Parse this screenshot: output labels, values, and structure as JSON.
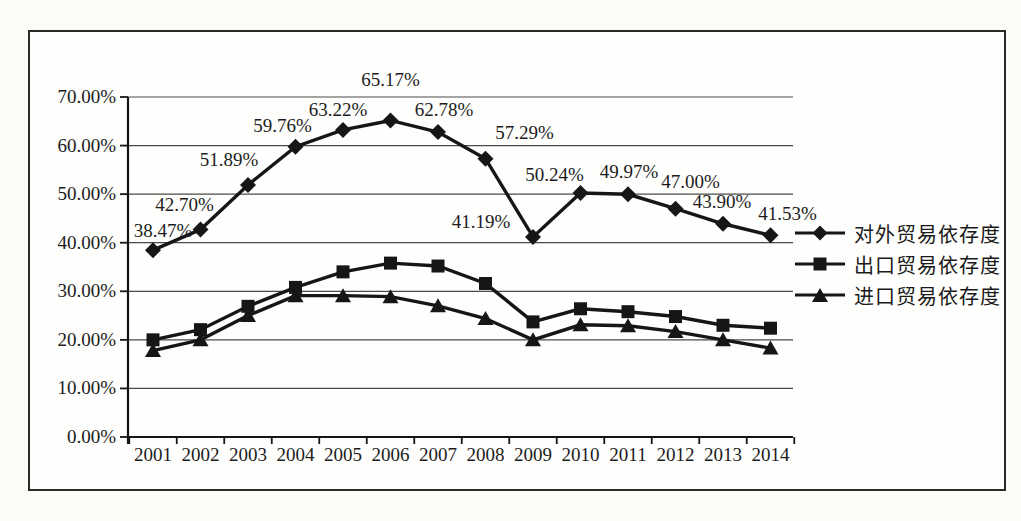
{
  "figure": {
    "background_color": "#fefefc",
    "border_color": "#2a2a2a",
    "ink_color": "#161616"
  },
  "chart_data": {
    "type": "line",
    "title": "",
    "xlabel": "",
    "ylabel": "",
    "categories": [
      "2001",
      "2002",
      "2003",
      "2004",
      "2005",
      "2006",
      "2007",
      "2008",
      "2009",
      "2010",
      "2011",
      "2012",
      "2013",
      "2014"
    ],
    "series": [
      {
        "name": "对外贸易依存度",
        "marker": "diamond",
        "values": [
          38.47,
          42.7,
          51.89,
          59.76,
          63.22,
          65.17,
          62.78,
          57.29,
          41.19,
          50.24,
          49.97,
          47.0,
          43.9,
          41.53
        ],
        "labels": [
          "38.47%",
          "42.70%",
          "51.89%",
          "59.76%",
          "63.22%",
          "65.17%",
          "62.78%",
          "57.29%",
          "41.19%",
          "50.24%",
          "49.97%",
          "47.00%",
          "43.90%",
          "41.53%"
        ]
      },
      {
        "name": "出口贸易依存度",
        "marker": "square",
        "values": [
          20.0,
          22.1,
          26.9,
          30.8,
          34.0,
          35.8,
          35.2,
          31.6,
          23.7,
          26.4,
          25.8,
          24.8,
          23.0,
          22.4
        ]
      },
      {
        "name": "进口贸易依存度",
        "marker": "triangle",
        "values": [
          17.8,
          20.0,
          25.0,
          29.1,
          29.1,
          28.9,
          27.0,
          24.4,
          20.0,
          23.1,
          22.9,
          21.7,
          20.0,
          18.3
        ]
      }
    ],
    "ylim": [
      0,
      70
    ],
    "ytick_step": 10,
    "ytick_labels": [
      "0.00%",
      "10.00%",
      "20.00%",
      "30.00%",
      "40.00%",
      "50.00%",
      "60.00%",
      "70.00%"
    ],
    "grid": "horizontal",
    "legend_position": "right",
    "ink_color": "#161616",
    "grid_color": "#4a4a4a"
  }
}
